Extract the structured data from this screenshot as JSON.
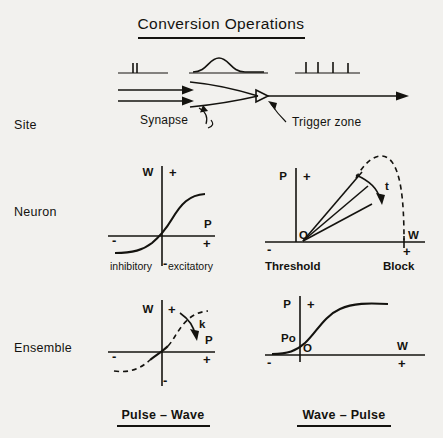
{
  "title": "Conversion Operations",
  "rows": [
    {
      "label": "Site"
    },
    {
      "label": "Neuron"
    },
    {
      "label": "Ensemble"
    }
  ],
  "site": {
    "annotations": {
      "synapse": "Synapse",
      "trigger_zone": "Trigger zone"
    },
    "traces": {
      "input_pulses_count": 2,
      "wave_label": "wave",
      "output_pulses_count": 4
    }
  },
  "panels": {
    "neuron_pulse_wave": {
      "y_axis_label": "W",
      "y_plus": "+",
      "y_minus": "-",
      "x_axis_label": "P",
      "x_plus": "+",
      "x_minus": "-",
      "left_caption": "inhibitory",
      "right_caption": "excitatory",
      "curve_type": "sigmoid"
    },
    "neuron_wave_pulse": {
      "y_axis_label": "P",
      "y_plus": "+",
      "x_axis_label": "W",
      "x_plus": "+",
      "x_minus": "-",
      "origin_label": "O",
      "parameter_label": "t",
      "left_caption": "Threshold",
      "right_caption": "Block",
      "curve_type": "fan-lines-with-dashed-envelope",
      "fan_line_count": 3
    },
    "ensemble_pulse_wave": {
      "y_axis_label": "W",
      "y_plus": "+",
      "y_minus": "-",
      "x_axis_label": "P",
      "x_plus": "+",
      "x_minus": "-",
      "parameter_label": "k",
      "curve_type": "dashed-sigmoid"
    },
    "ensemble_wave_pulse": {
      "y_axis_label": "P",
      "y_plus": "+",
      "x_axis_label": "W",
      "x_plus": "+",
      "x_minus": "-",
      "origin_label": "O",
      "intercept_label": "Po",
      "curve_type": "sigmoid"
    }
  },
  "footers": {
    "left": "Pulse – Wave",
    "right": "Wave – Pulse"
  },
  "colors": {
    "ink": "#14130f",
    "background": "#f2f1ee"
  }
}
